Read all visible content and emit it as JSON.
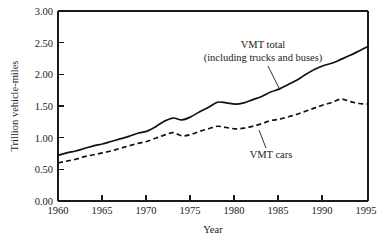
{
  "chart_data": {
    "type": "line",
    "title": "",
    "xlabel": "Year",
    "ylabel": "Trillion vehicle-miles",
    "xlim": [
      1960,
      1995
    ],
    "ylim": [
      0.0,
      3.0
    ],
    "grid": false,
    "legend_position": "inline-annotations",
    "xticks": [
      1960,
      1965,
      1970,
      1975,
      1980,
      1985,
      1990,
      1995
    ],
    "xtick_labels": [
      "1960",
      "1965",
      "1970",
      "1975",
      "1980",
      "1985",
      "1990",
      "1995"
    ],
    "yticks": [
      0.0,
      0.5,
      1.0,
      1.5,
      2.0,
      2.5,
      3.0
    ],
    "ytick_labels": [
      "0.00",
      "0.50",
      "1.00",
      "1.50",
      "2.00",
      "2.50",
      "3.00"
    ],
    "x": [
      1960,
      1961,
      1962,
      1963,
      1964,
      1965,
      1966,
      1967,
      1968,
      1969,
      1970,
      1971,
      1972,
      1973,
      1974,
      1975,
      1976,
      1977,
      1978,
      1979,
      1980,
      1981,
      1982,
      1983,
      1984,
      1985,
      1986,
      1987,
      1988,
      1989,
      1990,
      1991,
      1992,
      1993,
      1994,
      1995
    ],
    "series": [
      {
        "name": "VMT total",
        "style": "solid",
        "annotation": "VMT total (including trucks and buses)",
        "values": [
          0.72,
          0.76,
          0.79,
          0.83,
          0.87,
          0.9,
          0.94,
          0.98,
          1.02,
          1.07,
          1.1,
          1.17,
          1.26,
          1.31,
          1.28,
          1.33,
          1.41,
          1.48,
          1.56,
          1.55,
          1.53,
          1.55,
          1.6,
          1.65,
          1.72,
          1.77,
          1.84,
          1.91,
          2.0,
          2.08,
          2.14,
          2.18,
          2.24,
          2.3,
          2.37,
          2.44
        ]
      },
      {
        "name": "VMT cars",
        "style": "dashed",
        "annotation": "VMT cars",
        "values": [
          0.6,
          0.63,
          0.66,
          0.7,
          0.73,
          0.76,
          0.79,
          0.83,
          0.87,
          0.91,
          0.94,
          0.99,
          1.04,
          1.08,
          1.03,
          1.05,
          1.1,
          1.14,
          1.18,
          1.16,
          1.14,
          1.15,
          1.18,
          1.22,
          1.27,
          1.29,
          1.33,
          1.37,
          1.42,
          1.47,
          1.52,
          1.56,
          1.61,
          1.57,
          1.54,
          1.53
        ]
      }
    ],
    "annotations": [
      {
        "id": "vmt-total",
        "line1": "VMT total",
        "line2": "(including trucks and buses)"
      },
      {
        "id": "vmt-cars",
        "line1": "VMT cars"
      }
    ]
  }
}
